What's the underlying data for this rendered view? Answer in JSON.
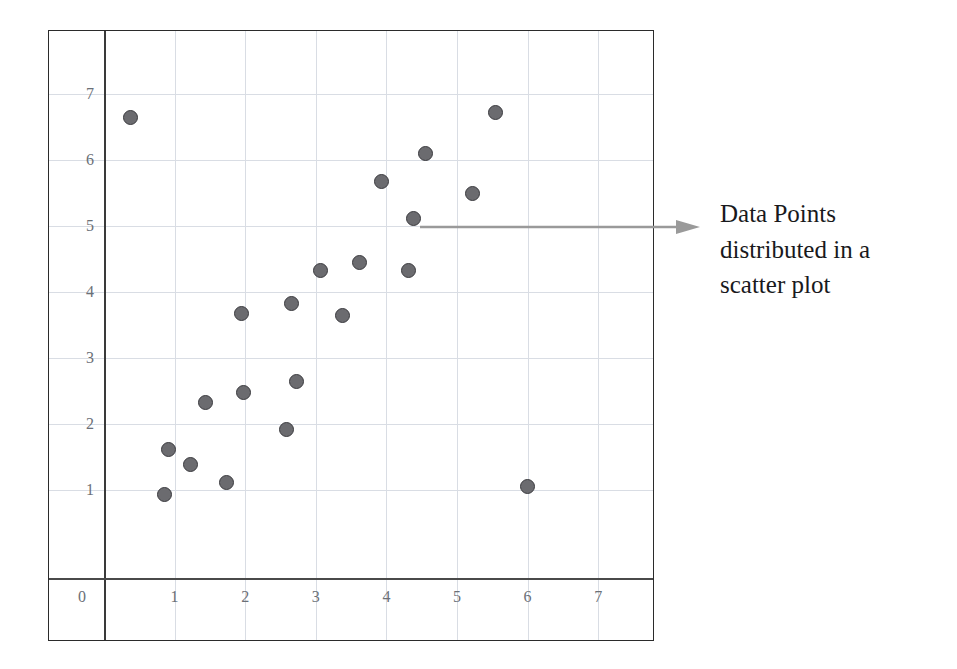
{
  "figure": {
    "annotation": {
      "arrow_icon": "right-arrow-icon",
      "arrow_color": "#9a9a9a",
      "caption_lines": [
        "Data Points",
        "distributed in a",
        "scatter plot"
      ],
      "caption_full": "Data Points distributed in a scatter plot"
    }
  },
  "chart_data": {
    "type": "scatter",
    "title": "",
    "xlabel": "",
    "ylabel": "",
    "xlim": [
      0,
      7.6
    ],
    "ylim": [
      0,
      7.6
    ],
    "grid": true,
    "legend": null,
    "x_ticks": [
      0,
      1,
      2,
      3,
      4,
      5,
      6,
      7
    ],
    "y_ticks": [
      1,
      2,
      3,
      4,
      5,
      6,
      7
    ],
    "x_tick_labels": [
      "0",
      "1",
      "2",
      "3",
      "4",
      "5",
      "6",
      "7"
    ],
    "y_tick_labels": [
      "1",
      "2",
      "3",
      "4",
      "5",
      "6",
      "7"
    ],
    "marker": {
      "shape": "circle",
      "fill": "#6b6b6f",
      "edge": "#3b3b3f",
      "size_px": 15
    },
    "series": [
      {
        "name": "Data Points",
        "points": [
          [
            0.38,
            6.65
          ],
          [
            5.54,
            6.72
          ],
          [
            4.55,
            6.1
          ],
          [
            3.93,
            5.67
          ],
          [
            5.22,
            5.5
          ],
          [
            4.38,
            5.12
          ],
          [
            3.62,
            4.45
          ],
          [
            3.07,
            4.32
          ],
          [
            4.31,
            4.32
          ],
          [
            2.65,
            3.83
          ],
          [
            1.95,
            3.67
          ],
          [
            3.38,
            3.65
          ],
          [
            2.73,
            2.65
          ],
          [
            1.97,
            2.48
          ],
          [
            1.44,
            2.33
          ],
          [
            2.58,
            1.92
          ],
          [
            0.92,
            1.62
          ],
          [
            1.22,
            1.38
          ],
          [
            1.73,
            1.12
          ],
          [
            6.0,
            1.05
          ],
          [
            0.85,
            0.93
          ]
        ]
      }
    ],
    "annotations": [
      {
        "text": "Data Points distributed in a scatter plot",
        "points_to": [
          4.45,
          5.1
        ],
        "arrow": true
      }
    ]
  }
}
